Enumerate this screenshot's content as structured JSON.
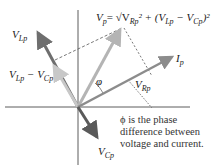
{
  "diagram": {
    "type": "phasor-diagram",
    "colors": {
      "axis": "#333333",
      "v_lp": "#6e6e6e",
      "v_cp": "#5a5a5a",
      "v_lp_minus_v_cp": "#c8c8c8",
      "v_p": "#b4b4b4",
      "v_rp": "#8c8c8c",
      "dashed": "#555555"
    },
    "labels": {
      "v_lp": {
        "main": "V",
        "sub": "Lp"
      },
      "v_lp_minus_v_cp": {
        "a": "V",
        "a_sub": "Lp",
        "op": " − ",
        "b": "V",
        "b_sub": "Cp"
      },
      "v_p": {
        "main": "V",
        "sub": "p"
      },
      "v_p_formula": "= √V",
      "formula_rp_sub": "Rp",
      "formula_rest": "² + (V",
      "formula_lp_sub": "Lp",
      "formula_minus": " − V",
      "formula_cp_sub": "Cp",
      "formula_close": ")²",
      "i_p": {
        "main": "I",
        "sub": "p"
      },
      "v_rp": {
        "main": "V",
        "sub": "Rp"
      },
      "v_cp": {
        "main": "V",
        "sub": "Cp"
      },
      "phi": "φ"
    },
    "annotation": {
      "line1": "ϕ is the phase",
      "line2": "difference between",
      "line3": "voltage and current."
    }
  }
}
